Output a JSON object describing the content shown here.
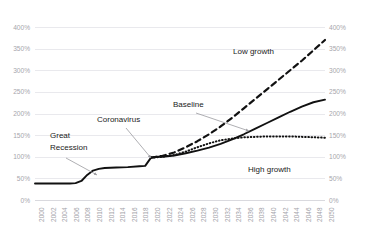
{
  "chart_data": {
    "type": "line",
    "title": "",
    "xlabel": "",
    "ylabel": "",
    "ylim": [
      0,
      400
    ],
    "ytick_suffix": "%",
    "grid": true,
    "legend_position": "inline-annotations",
    "dual_y_axis": true,
    "y_ticks": [
      "0%",
      "50%",
      "100%",
      "150%",
      "200%",
      "250%",
      "300%",
      "350%",
      "400%"
    ],
    "y_tick_values": [
      0,
      50,
      100,
      150,
      200,
      250,
      300,
      350,
      400
    ],
    "x": [
      2000,
      2002,
      2004,
      2006,
      2008,
      2010,
      2012,
      2014,
      2016,
      2018,
      2020,
      2022,
      2024,
      2026,
      2028,
      2030,
      2032,
      2034,
      2036,
      2038,
      2040,
      2042,
      2044,
      2046,
      2048,
      2050
    ],
    "x_tick_labels": [
      "2000",
      "2002",
      "2004",
      "2006",
      "2008",
      "2010",
      "2012",
      "2014",
      "2016",
      "2018",
      "2020",
      "2022",
      "2024",
      "2026",
      "2028",
      "2030",
      "2032",
      "2034",
      "2036",
      "2038",
      "2040",
      "2042",
      "2044",
      "2046",
      "2048",
      "2050"
    ],
    "series": [
      {
        "name": "Baseline",
        "style": "solid",
        "color": "#111111",
        "x": [
          2000,
          2002,
          2004,
          2006,
          2007,
          2008,
          2009,
          2010,
          2011,
          2012,
          2014,
          2016,
          2018,
          2019,
          2020,
          2021,
          2022,
          2024,
          2026,
          2028,
          2030,
          2032,
          2034,
          2036,
          2038,
          2040,
          2042,
          2044,
          2046,
          2048,
          2050
        ],
        "values": [
          38,
          38,
          38,
          38,
          39,
          44,
          58,
          68,
          72,
          74,
          75,
          76,
          78,
          79,
          98,
          100,
          100,
          103,
          108,
          114,
          121,
          130,
          140,
          152,
          165,
          178,
          191,
          204,
          216,
          226,
          232
        ]
      },
      {
        "name": "Low growth",
        "style": "dashed",
        "color": "#111111",
        "x": [
          2020,
          2021,
          2022,
          2024,
          2026,
          2028,
          2030,
          2032,
          2034,
          2036,
          2038,
          2040,
          2042,
          2044,
          2046,
          2048,
          2050
        ],
        "values": [
          98,
          100,
          102,
          110,
          122,
          136,
          152,
          170,
          190,
          212,
          234,
          256,
          278,
          300,
          322,
          346,
          370
        ]
      },
      {
        "name": "High growth",
        "style": "dotted",
        "color": "#111111",
        "x": [
          2020,
          2021,
          2022,
          2024,
          2026,
          2028,
          2030,
          2032,
          2034,
          2036,
          2038,
          2040,
          2042,
          2044,
          2046,
          2048,
          2050
        ],
        "values": [
          98,
          99,
          100,
          104,
          112,
          122,
          131,
          138,
          142,
          145,
          146,
          147,
          147,
          147,
          146,
          145,
          144
        ]
      }
    ],
    "annotations": [
      {
        "id": "great-recession",
        "text": "Great",
        "text2": "Recession",
        "points_to": 2009
      },
      {
        "id": "coronavirus",
        "text": "Coronavirus",
        "points_to": 2020
      },
      {
        "id": "baseline",
        "text": "Baseline",
        "points_to": 2036
      },
      {
        "id": "low-growth",
        "text": "Low growth",
        "points_to": 2046
      },
      {
        "id": "high-growth",
        "text": "High growth",
        "points_to": 2044
      }
    ]
  },
  "axes": {
    "left_labels": [
      "400%",
      "350%",
      "300%",
      "250%",
      "200%",
      "150%",
      "100%",
      "50%",
      "0%"
    ],
    "right_labels": [
      "400%",
      "350%",
      "300%",
      "250%",
      "200%",
      "150%",
      "100%",
      "50%",
      "0%"
    ]
  },
  "labels": {
    "great_recession_line1": "Great",
    "great_recession_line2": "Recession",
    "coronavirus": "Coronavirus",
    "baseline": "Baseline",
    "low_growth": "Low growth",
    "high_growth": "High growth"
  },
  "colors": {
    "line": "#111111",
    "grid": "#e9e9ed",
    "tick_text": "#a6a6ac",
    "annotation_text": "#1b1b1b",
    "arrow": "#9a9a9f",
    "background": "#ffffff"
  }
}
